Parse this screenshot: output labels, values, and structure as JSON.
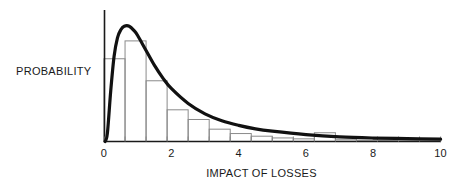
{
  "chart_data": {
    "type": "bar",
    "title": "",
    "subtitle": "",
    "xlabel": "IMPACT OF LOSSES",
    "ylabel": "PROBABILITY",
    "xlim": [
      0,
      10
    ],
    "ylim": [
      0,
      1.05
    ],
    "grid": false,
    "legend": null,
    "x_tick_labels": [
      "0",
      "2",
      "4",
      "6",
      "8",
      "10"
    ],
    "x_tick_values": [
      0,
      2,
      4,
      6,
      8,
      10
    ],
    "y_tick_labels": [],
    "minor_tick_spacing": 0.625,
    "bin_width": 0.625,
    "bin_edges": [
      0,
      0.625,
      1.25,
      1.875,
      2.5,
      3.125,
      3.75,
      4.375,
      5.0,
      5.625,
      6.25,
      6.875,
      7.5,
      8.125,
      8.75,
      9.375,
      10.0
    ],
    "categories": [
      "0-0.63",
      "0.63-1.25",
      "1.25-1.88",
      "1.88-2.5",
      "2.5-3.13",
      "3.13-3.75",
      "3.75-4.38",
      "4.38-5",
      "5-5.63",
      "5.63-6.25",
      "6.25-6.88",
      "6.88-7.5",
      "7.5-8.13",
      "8.13-8.75",
      "8.75-9.38",
      "9.38-10"
    ],
    "values": [
      0.718,
      0.873,
      0.527,
      0.275,
      0.191,
      0.107,
      0.069,
      0.046,
      0.031,
      0.023,
      0.076,
      0.015,
      0.011,
      0.008,
      0.006,
      0.005
    ],
    "series": [
      {
        "name": "histogram",
        "values": [
          0.718,
          0.873,
          0.527,
          0.275,
          0.191,
          0.107,
          0.069,
          0.046,
          0.031,
          0.023,
          0.076,
          0.015,
          0.011,
          0.008,
          0.006,
          0.005
        ]
      },
      {
        "name": "fitted-curve",
        "type": "line",
        "distribution": "lognormal",
        "peak_x": 0.75,
        "peak_y": 1.0,
        "x": [
          0.03,
          0.1,
          0.2,
          0.3,
          0.4,
          0.5,
          0.6,
          0.75,
          0.9,
          1.0,
          1.25,
          1.5,
          1.75,
          2.0,
          2.5,
          3.0,
          3.5,
          4.0,
          4.5,
          5.0,
          6.0,
          7.0,
          8.0,
          9.0,
          10.0
        ],
        "y": [
          0.0,
          0.07,
          0.44,
          0.74,
          0.9,
          0.97,
          1.0,
          1.0,
          0.96,
          0.92,
          0.79,
          0.66,
          0.55,
          0.46,
          0.33,
          0.24,
          0.18,
          0.14,
          0.11,
          0.09,
          0.06,
          0.04,
          0.03,
          0.025,
          0.02
        ]
      }
    ],
    "annotations": [
      {
        "text": "anomalous-elevated-bin",
        "bin_index": 10,
        "range": [
          6.25,
          6.875
        ]
      }
    ],
    "colors": {
      "axis": "#1a1a1a",
      "curve": "#111111",
      "histogram_outline": "#8a8a8a",
      "background": "#ffffff",
      "text": "#1a1a1a"
    }
  }
}
